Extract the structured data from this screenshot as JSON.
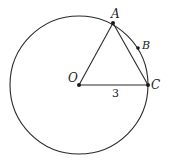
{
  "diagram": {
    "colors": {
      "stroke": "#2a2a2a",
      "background": "#ffffff"
    },
    "circle": {
      "center": "O",
      "cx": 79,
      "cy": 85,
      "r": 69
    },
    "points": [
      {
        "id": "O",
        "label": "O",
        "x": 79,
        "y": 85,
        "label_x": 68,
        "label_y": 82
      },
      {
        "id": "A",
        "label": "A",
        "x": 113,
        "y": 23,
        "label_x": 111,
        "label_y": 19
      },
      {
        "id": "B",
        "label": "B",
        "x": 138,
        "y": 48,
        "label_x": 142,
        "label_y": 49
      },
      {
        "id": "C",
        "label": "C",
        "x": 148,
        "y": 85,
        "label_x": 151,
        "label_y": 89
      }
    ],
    "segments": [
      {
        "from": "O",
        "to": "A"
      },
      {
        "from": "A",
        "to": "C"
      },
      {
        "from": "O",
        "to": "C",
        "label": "3"
      }
    ],
    "annotations": {
      "oc_length": "3"
    }
  }
}
